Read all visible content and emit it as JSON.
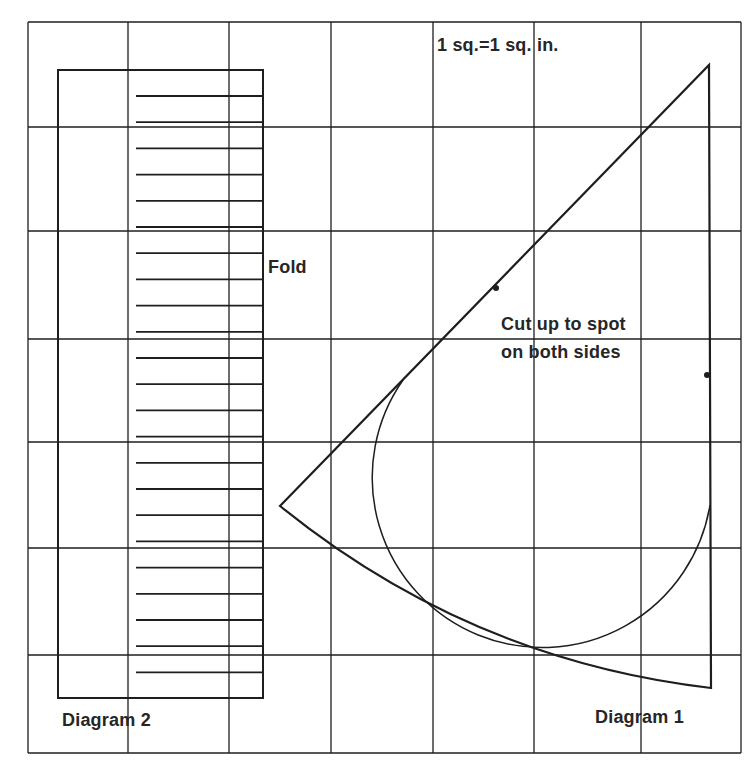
{
  "labels": {
    "scale": "1 sq.=1 sq. in.",
    "fold": "Fold",
    "cut_line1": "Cut up to spot",
    "cut_line2": "on both sides",
    "diagram2": "Diagram 2",
    "diagram1": "Diagram 1"
  },
  "colors": {
    "line": "#1e1e1e",
    "text": "#262626",
    "background": "#ffffff"
  },
  "grid": {
    "vertical_x": [
      28,
      128,
      229,
      331,
      433,
      534,
      641,
      741
    ],
    "horizontal_y": [
      22,
      127,
      231,
      339,
      442,
      548,
      655,
      753
    ],
    "square_size_label": "1 sq.=1 sq. in."
  },
  "diagram2": {
    "rect": {
      "x": 58,
      "y": 70,
      "w": 205,
      "h": 628
    },
    "fringe_lines": {
      "x_start": 136,
      "x_end": 263,
      "y_first": 96,
      "count": 23,
      "spacing": 26.2
    }
  },
  "diagram1": {
    "apex": [
      709,
      65
    ],
    "tip": [
      280,
      506
    ],
    "bottom_right": [
      711,
      688
    ],
    "spots": [
      [
        496,
        288
      ],
      [
        707,
        375
      ]
    ],
    "circle": {
      "cx": 540,
      "cy": 488,
      "r": 170
    }
  }
}
